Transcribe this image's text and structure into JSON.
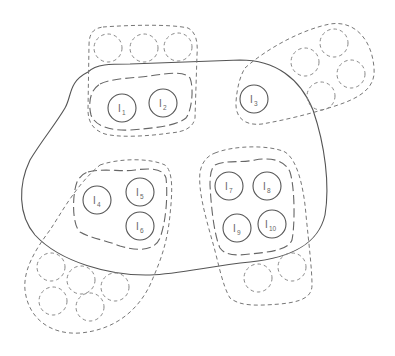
{
  "diagram": {
    "type": "set-cluster-diagram",
    "nodes": [
      {
        "id": "I1",
        "base": "I",
        "sub": "1",
        "x": 122,
        "y": 108
      },
      {
        "id": "I2",
        "base": "I",
        "sub": "2",
        "x": 163,
        "y": 103
      },
      {
        "id": "I3",
        "base": "I",
        "sub": "3",
        "x": 254,
        "y": 99
      },
      {
        "id": "I4",
        "base": "I",
        "sub": "4",
        "x": 97,
        "y": 200
      },
      {
        "id": "I5",
        "base": "I",
        "sub": "5",
        "x": 140,
        "y": 192
      },
      {
        "id": "I6",
        "base": "I",
        "sub": "6",
        "x": 140,
        "y": 226
      },
      {
        "id": "I7",
        "base": "I",
        "sub": "7",
        "x": 229,
        "y": 186
      },
      {
        "id": "I8",
        "base": "I",
        "sub": "8",
        "x": 267,
        "y": 186
      },
      {
        "id": "I9",
        "base": "I",
        "sub": "9",
        "x": 237,
        "y": 228
      },
      {
        "id": "I10",
        "base": "I",
        "sub": "10",
        "x": 272,
        "y": 224
      }
    ],
    "ghost_nodes": [
      {
        "x": 108,
        "y": 48
      },
      {
        "x": 144,
        "y": 48
      },
      {
        "x": 178,
        "y": 47
      },
      {
        "x": 305,
        "y": 62
      },
      {
        "x": 334,
        "y": 43
      },
      {
        "x": 351,
        "y": 74
      },
      {
        "x": 321,
        "y": 96
      },
      {
        "x": 51,
        "y": 267
      },
      {
        "x": 81,
        "y": 280
      },
      {
        "x": 115,
        "y": 287
      },
      {
        "x": 53,
        "y": 301
      },
      {
        "x": 90,
        "y": 307
      },
      {
        "x": 258,
        "y": 278
      },
      {
        "x": 292,
        "y": 267
      }
    ],
    "groups": [
      {
        "name": "top-group",
        "members": [
          "I1",
          "I2"
        ]
      },
      {
        "name": "right-top-group",
        "members": [
          "I3"
        ]
      },
      {
        "name": "left-bottom-group",
        "members": [
          "I4",
          "I5",
          "I6"
        ]
      },
      {
        "name": "right-bottom-group",
        "members": [
          "I7",
          "I8",
          "I9",
          "I10"
        ]
      }
    ],
    "colors": {
      "stroke": "#555555",
      "dashed": "#777777",
      "text": "#666666"
    }
  }
}
